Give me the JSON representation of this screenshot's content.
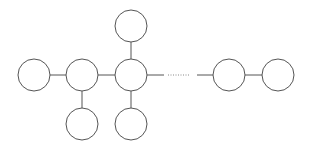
{
  "diagram": {
    "type": "tree-chain",
    "stroke_color": "#555555",
    "fill_color": "#ffffff",
    "node_radius": 16,
    "nodes": [
      {
        "id": "n1",
        "cx": 34,
        "cy": 75
      },
      {
        "id": "n2",
        "cx": 82,
        "cy": 75
      },
      {
        "id": "n3",
        "cx": 131,
        "cy": 75
      },
      {
        "id": "n4",
        "cx": 131,
        "cy": 26
      },
      {
        "id": "n5",
        "cx": 82,
        "cy": 124
      },
      {
        "id": "n6",
        "cx": 131,
        "cy": 124
      },
      {
        "id": "n7",
        "cx": 229,
        "cy": 75
      },
      {
        "id": "n8",
        "cx": 278,
        "cy": 75
      }
    ],
    "edges": [
      {
        "from": "n1",
        "to": "n2",
        "style": "solid"
      },
      {
        "from": "n2",
        "to": "n3",
        "style": "solid"
      },
      {
        "from": "n3",
        "to": "n4",
        "style": "solid"
      },
      {
        "from": "n2",
        "to": "n5",
        "style": "solid"
      },
      {
        "from": "n3",
        "to": "n6",
        "style": "solid"
      },
      {
        "from": "n3",
        "to": "n7",
        "style": "ellipsis"
      },
      {
        "from": "n7",
        "to": "n8",
        "style": "solid"
      }
    ]
  }
}
